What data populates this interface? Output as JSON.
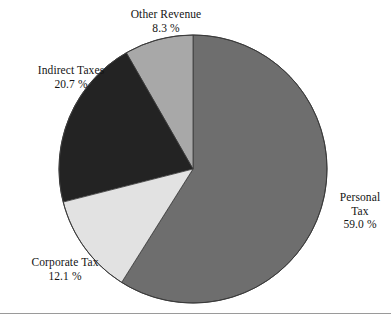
{
  "chart_data": {
    "type": "pie",
    "title": "",
    "subtitle": "",
    "xlabel": "",
    "ylabel": "",
    "legend_position": "none",
    "grid": false,
    "label_mode": "outside-with-percent",
    "start_angle_deg": 90,
    "direction": "counterclockwise",
    "categories": [
      "Personal Tax",
      "Other Revenue",
      "Indirect Taxes",
      "Corporate Tax"
    ],
    "values": [
      59.0,
      8.3,
      20.7,
      12.1
    ],
    "unit": "%",
    "slices": [
      {
        "name": "Personal Tax",
        "label_line1": "Personal",
        "label_line2": "Tax",
        "value": 59.0,
        "value_text": "59.0 %",
        "color": "#6e6e6e"
      },
      {
        "name": "Other Revenue",
        "label_line1": "Other Revenue",
        "label_line2": "",
        "value": 8.3,
        "value_text": "8.3 %",
        "color": "#a8a8a8"
      },
      {
        "name": "Indirect Taxes",
        "label_line1": "Indirect Taxes",
        "label_line2": "",
        "value": 20.7,
        "value_text": "20.7 %",
        "color": "#232323"
      },
      {
        "name": "Corporate Tax",
        "label_line1": "Corporate Tax",
        "label_line2": "",
        "value": 12.1,
        "value_text": "12.1 %",
        "color": "#e2e2e2"
      }
    ],
    "geometry": {
      "center_x": 193,
      "center_y": 169,
      "radius": 134
    },
    "outline_color": "#3a3a3a",
    "background_color": "#ffffff",
    "rule_color": "#9a9a9a"
  }
}
